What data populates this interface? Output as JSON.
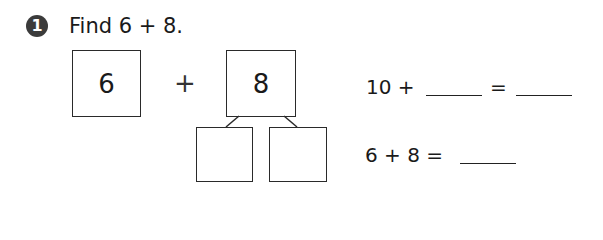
{
  "problem": {
    "number": "1",
    "prompt": "Find 6 + 8.",
    "addend1": "6",
    "operator": "+",
    "addend2": "8",
    "split_boxes": [
      "",
      ""
    ],
    "equation1": {
      "left": "10 +",
      "blank1": "",
      "equals": "=",
      "blank2": ""
    },
    "equation2": {
      "left": "6 + 8 =",
      "blank": ""
    }
  }
}
